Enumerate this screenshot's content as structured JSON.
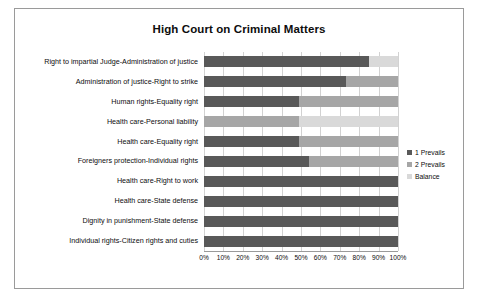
{
  "chart_data": {
    "type": "bar",
    "title": "High Court on Criminal Matters",
    "xlabel": "",
    "ylabel": "",
    "orientation": "horizontal",
    "stacked": true,
    "stack_mode": "percent",
    "xlim": [
      0,
      100
    ],
    "grid": true,
    "legend_position": "right",
    "tick_labels": [
      "0%",
      "10%",
      "20%",
      "30%",
      "40%",
      "50%",
      "60%",
      "70%",
      "80%",
      "90%",
      "100%"
    ],
    "tick_values": [
      0,
      10,
      20,
      30,
      40,
      50,
      60,
      70,
      80,
      90,
      100
    ],
    "categories": [
      "Right to impartial Judge-Administration of justice",
      "Administration of justice-Right to strike",
      "Human rights-Equality right",
      "Health care-Personal liability",
      "Health care-Equality right",
      "Foreigners protection-Individual rights",
      "Health care-Right to work",
      "Health care-State defense",
      "Dignity in punishment-State defense",
      "Individual rights-Citizen rights and cuties"
    ],
    "series": [
      {
        "name": "1 Prevails",
        "color": "#595959",
        "values": [
          85,
          73,
          49,
          0,
          49,
          54,
          100,
          100,
          100,
          100
        ]
      },
      {
        "name": "2 Prevails",
        "color": "#a6a6a6",
        "values": [
          0,
          27,
          51,
          49,
          51,
          46,
          0,
          0,
          0,
          0
        ]
      },
      {
        "name": "Balance",
        "color": "#d9d9d9",
        "values": [
          15,
          0,
          0,
          51,
          0,
          0,
          0,
          0,
          0,
          0
        ]
      }
    ]
  }
}
